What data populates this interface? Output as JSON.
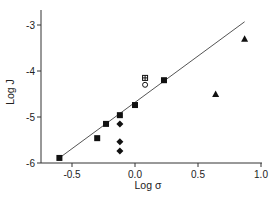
{
  "chart_data": {
    "type": "scatter",
    "title": "",
    "xlabel": "Log σ",
    "ylabel": "Log J",
    "xlim": [
      -0.75,
      1.0
    ],
    "ylim": [
      -6,
      -2.6
    ],
    "xticks": [
      -0.5,
      0.0,
      0.5,
      1.0
    ],
    "xtick_labels": [
      "-0.5",
      "0.0",
      "0.5",
      "1.0"
    ],
    "yticks": [
      -6,
      -5,
      -4,
      -3
    ],
    "ytick_labels": [
      "-6",
      "-5",
      "-4",
      "-3"
    ],
    "grid": false,
    "legend": null,
    "series": [
      {
        "name": "filled squares",
        "marker": "square",
        "filled": true,
        "points": [
          [
            -0.6,
            -5.89
          ],
          [
            -0.3,
            -5.46
          ],
          [
            -0.23,
            -5.15
          ],
          [
            -0.12,
            -4.96
          ],
          [
            0.0,
            -4.74
          ],
          [
            0.23,
            -4.2
          ]
        ]
      },
      {
        "name": "filled diamonds",
        "marker": "diamond",
        "filled": true,
        "points": [
          [
            -0.12,
            -5.15
          ],
          [
            -0.12,
            -5.54
          ],
          [
            -0.12,
            -5.74
          ]
        ]
      },
      {
        "name": "crossed square",
        "marker": "crossed-square",
        "filled": false,
        "points": [
          [
            0.08,
            -4.15
          ]
        ]
      },
      {
        "name": "open circle",
        "marker": "circle",
        "filled": false,
        "points": [
          [
            0.08,
            -4.3
          ]
        ]
      },
      {
        "name": "filled triangles",
        "marker": "triangle",
        "filled": true,
        "points": [
          [
            0.87,
            -3.3
          ],
          [
            0.64,
            -4.5
          ]
        ]
      }
    ],
    "fit_line": {
      "x": [
        -0.6,
        0.87
      ],
      "y": [
        -5.89,
        -2.93
      ]
    }
  }
}
